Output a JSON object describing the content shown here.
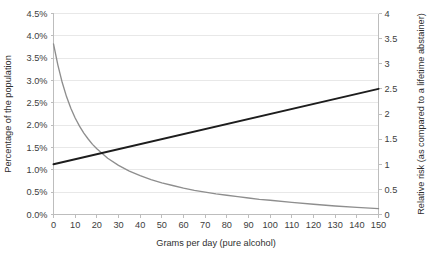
{
  "chart_data": {
    "type": "line",
    "title": "",
    "xlabel": "Grams per day (pure alcohol)",
    "ylabel": "Percentage of the population",
    "y2label": "Relative risk (as compared to a lifetime abstainer)",
    "xlim": [
      0,
      150
    ],
    "ylim": [
      0,
      4.5
    ],
    "y2lim": [
      0,
      4
    ],
    "grid": true,
    "legend": "none",
    "xticks": [
      0,
      10,
      20,
      30,
      40,
      50,
      60,
      70,
      80,
      90,
      100,
      110,
      120,
      130,
      140,
      150
    ],
    "xticklabels": [
      "0",
      "10",
      "20",
      "30",
      "40",
      "50",
      "60",
      "70",
      "80",
      "90",
      "100",
      "110",
      "120",
      "130",
      "140",
      "150"
    ],
    "yticks": [
      0.0,
      0.5,
      1.0,
      1.5,
      2.0,
      2.5,
      3.0,
      3.5,
      4.0,
      4.5
    ],
    "yticklabels": [
      "0.0%",
      "0.5%",
      "1.0%",
      "1.5%",
      "2.0%",
      "2.5%",
      "3.0%",
      "3.5%",
      "4.0%",
      "4.5%"
    ],
    "y2ticks": [
      0,
      0.5,
      1,
      1.5,
      2,
      2.5,
      3,
      3.5,
      4
    ],
    "y2ticklabels": [
      "0",
      "0.5",
      "1",
      "1.5",
      "2",
      "2.5",
      "3",
      "3.5",
      "4"
    ],
    "series": [
      {
        "name": "Percentage of the population",
        "axis": "left",
        "color": "#8e8e8e",
        "x": [
          0,
          2,
          4,
          6,
          8,
          10,
          12,
          14,
          16,
          18,
          20,
          25,
          30,
          35,
          40,
          45,
          50,
          55,
          60,
          65,
          70,
          75,
          80,
          85,
          90,
          95,
          100,
          110,
          120,
          130,
          140,
          150
        ],
        "values": [
          3.82,
          3.35,
          2.96,
          2.64,
          2.38,
          2.16,
          1.98,
          1.82,
          1.69,
          1.57,
          1.47,
          1.26,
          1.1,
          0.97,
          0.87,
          0.78,
          0.71,
          0.65,
          0.59,
          0.54,
          0.5,
          0.46,
          0.43,
          0.4,
          0.37,
          0.34,
          0.32,
          0.27,
          0.23,
          0.19,
          0.16,
          0.13
        ]
      },
      {
        "name": "Relative risk (as compared to a lifetime abstainer)",
        "axis": "right",
        "color": "#1d1d1d",
        "x": [
          0,
          150
        ],
        "values": [
          1.0,
          2.5
        ]
      }
    ]
  },
  "axes": {
    "x_title": "Grams per day (pure alcohol)",
    "y_left_title": "Percentage of the population",
    "y_right_title": "Relative risk (as compared to a lifetime abstainer)"
  }
}
